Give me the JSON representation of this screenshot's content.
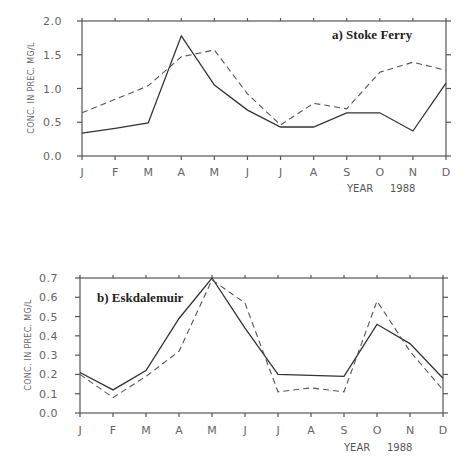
{
  "chart_data": [
    {
      "type": "line",
      "title": "a) Stoke Ferry",
      "xlabel": "YEAR 1988",
      "ylabel": "CONC. IN PREC. MG/L",
      "categories": [
        "J",
        "F",
        "M",
        "A",
        "M",
        "J",
        "J",
        "A",
        "S",
        "O",
        "N",
        "D"
      ],
      "yticks": [
        "0.0",
        "0.5",
        "1.0",
        "1.5",
        "2.0"
      ],
      "ylim": [
        0,
        2.0
      ],
      "grid": false,
      "series": [
        {
          "name": "solid",
          "style": "solid",
          "values": [
            0.34,
            0.41,
            0.49,
            1.78,
            1.05,
            0.68,
            0.43,
            0.43,
            0.64,
            0.64,
            0.37,
            1.08
          ]
        },
        {
          "name": "dashed",
          "style": "dashed",
          "values": [
            0.64,
            0.84,
            1.04,
            1.47,
            1.57,
            0.92,
            0.46,
            0.78,
            0.7,
            1.24,
            1.39,
            1.27
          ]
        }
      ]
    },
    {
      "type": "line",
      "title": "b) Eskdalemuir",
      "xlabel": "YEAR 1988",
      "ylabel": "CONC. IN PREC. MG/L",
      "categories": [
        "J",
        "F",
        "M",
        "A",
        "M",
        "J",
        "J",
        "A",
        "S",
        "O",
        "N",
        "D"
      ],
      "yticks": [
        "0.0",
        "0.1",
        "0.2",
        "0.3",
        "0.4",
        "0.5",
        "0.6",
        "0.7"
      ],
      "ylim": [
        0,
        0.7
      ],
      "grid": false,
      "series": [
        {
          "name": "solid",
          "style": "solid",
          "values": [
            0.21,
            0.12,
            0.22,
            0.49,
            0.7,
            0.44,
            0.2,
            0.195,
            0.19,
            0.46,
            0.36,
            0.18
          ]
        },
        {
          "name": "dashed",
          "style": "dashed",
          "values": [
            0.2,
            0.08,
            0.19,
            0.32,
            0.69,
            0.57,
            0.11,
            0.13,
            0.11,
            0.58,
            0.32,
            0.12
          ]
        }
      ]
    }
  ],
  "panels": {
    "a": {
      "title": "a) Stoke Ferry",
      "ylabel": "CONC. IN PREC. MG/L",
      "xlabel_word": "YEAR",
      "xlabel_year": "1988"
    },
    "b": {
      "title": "b) Eskdalemuir",
      "ylabel": "CONC. IN PREC. MG/L",
      "xlabel_word": "YEAR",
      "xlabel_year": "1988"
    }
  }
}
